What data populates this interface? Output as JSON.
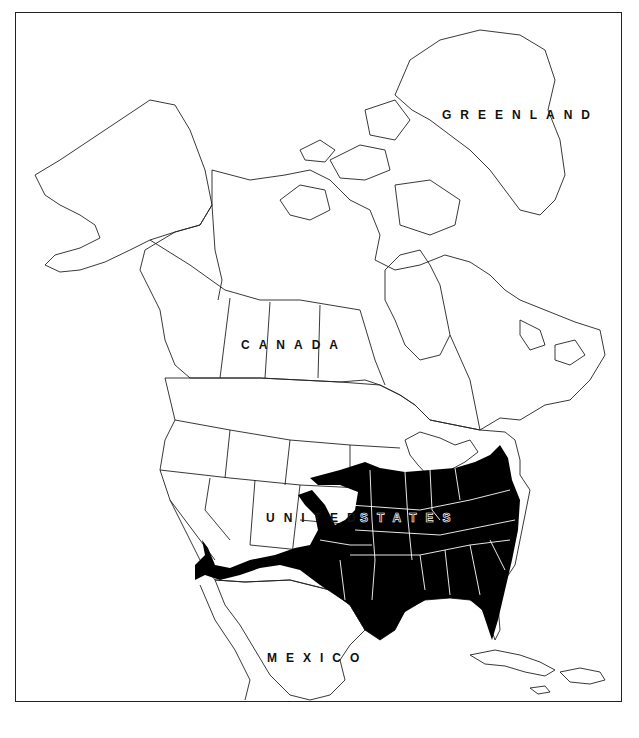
{
  "map": {
    "type": "range-map",
    "region": "North America",
    "labels": {
      "greenland": "GREENLAND",
      "canada": "CANADA",
      "united_states_left": "UNITED",
      "united_states_right": "STATES",
      "mexico": "MEXICO"
    },
    "colors": {
      "range_fill": "#000000",
      "land_fill": "#ffffff",
      "outline": "#222222",
      "border_on_range": "#ffffff"
    },
    "range_description": "Eastern and south-central United States, from the Great Plains and southern Great Lakes to the Atlantic coast and Florida, extending west through Texas, southern New Mexico and southern Arizona, with a northward lobe into Colorado"
  }
}
